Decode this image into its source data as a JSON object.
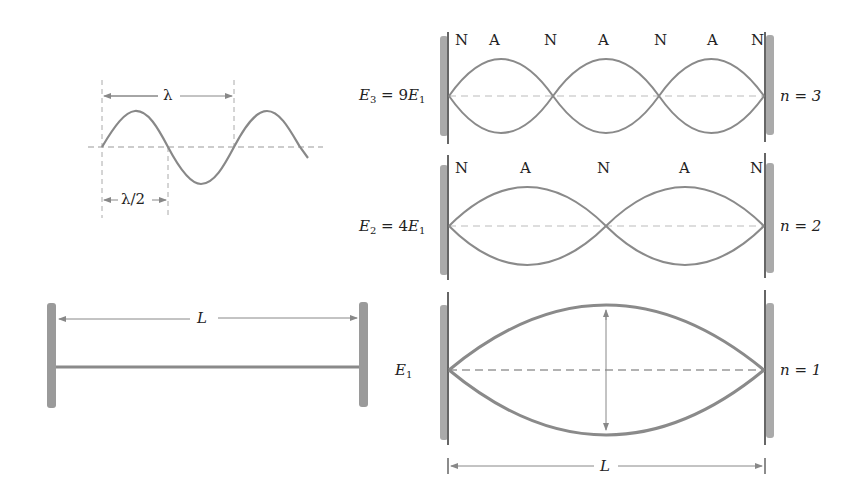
{
  "wavelength_panel": {
    "lambda_label": "λ",
    "half_lambda_label": "λ/2"
  },
  "string_panel": {
    "length_label": "L"
  },
  "modes": [
    {
      "n_label": "n = 3",
      "energy": {
        "sym": "E",
        "sub": "3",
        "eq": " = 9",
        "sym2": "E",
        "sub2": "1"
      },
      "node_labels": [
        "N",
        "A",
        "N",
        "A",
        "N",
        "A",
        "N"
      ]
    },
    {
      "n_label": "n = 2",
      "energy": {
        "sym": "E",
        "sub": "2",
        "eq": " = 4",
        "sym2": "E",
        "sub2": "1"
      },
      "node_labels": [
        "N",
        "A",
        "N",
        "A",
        "N"
      ]
    },
    {
      "n_label": "n = 1",
      "energy": {
        "sym": "E",
        "sub": "1"
      },
      "node_labels": []
    }
  ],
  "bottom_dimension": {
    "label": "L"
  },
  "colors": {
    "curve": "#8a8a8a",
    "wall": "#999999",
    "dash": "#aaaaaa",
    "text": "#222222"
  }
}
